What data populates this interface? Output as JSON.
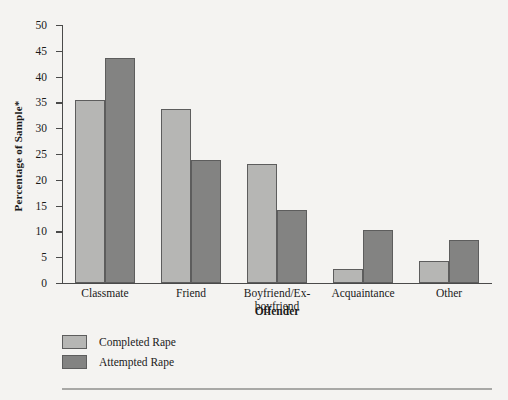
{
  "chart_data": {
    "type": "bar",
    "title": "",
    "xlabel": "Offender",
    "ylabel": "Percentage of Sample*",
    "categories": [
      "Classmate",
      "Friend",
      "Boyfriend/Ex-\nboyfriend",
      "Acquaintance",
      "Other"
    ],
    "series": [
      {
        "name": "Completed Rape",
        "color": "#b6b6b4",
        "values": [
          35.5,
          33.7,
          23.0,
          2.8,
          4.3
        ]
      },
      {
        "name": "Attempted Rape",
        "color": "#838382",
        "values": [
          43.7,
          23.9,
          14.2,
          10.3,
          8.3
        ]
      }
    ],
    "ylim": [
      0,
      50
    ],
    "yticks": [
      0,
      5,
      10,
      15,
      20,
      25,
      30,
      35,
      40,
      45,
      50
    ],
    "grid": false,
    "legend_position": "bottom-left"
  },
  "legend": {
    "items": [
      {
        "label": "Completed Rape"
      },
      {
        "label": "Attempted Rape"
      }
    ]
  }
}
